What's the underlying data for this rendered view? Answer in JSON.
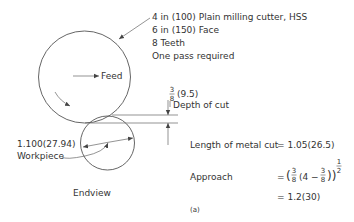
{
  "cutter_spec": {
    "line1": "4 in (100) Plain milling cutter, HSS",
    "line2": "6 in (150) Face",
    "line3": "8 Teeth",
    "line4": "One pass required"
  },
  "feed_label": "Feed",
  "depth_of_cut": {
    "fraction_num": "3",
    "fraction_den": "8",
    "metric": "(9.5)",
    "label": "Depth of cut"
  },
  "workpiece": {
    "diameter": "1.100(27.94)",
    "label": "Workpiece"
  },
  "view_label": "Endview",
  "calculations": {
    "length_label": "Length of metal cut",
    "length_value": "= 1.05(26.5)",
    "approach_label": "Approach",
    "approach_eq": "=",
    "approach_open": "(",
    "frac1_num": "3",
    "frac1_den": "8",
    "inner_open": "(4 −",
    "frac2_num": "3",
    "frac2_den": "8",
    "inner_close": "))",
    "exp_num": "1",
    "exp_den": "2",
    "result": "= 1.2(30)"
  },
  "figure_label": "(a)"
}
